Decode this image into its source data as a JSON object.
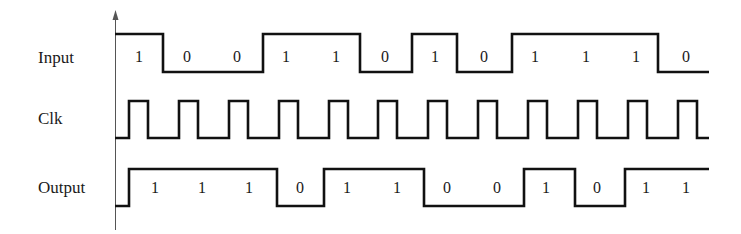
{
  "diagram": {
    "colors": {
      "wave": "#111111",
      "axis": "#555555",
      "text": "#1a1a1a",
      "background": "#ffffff"
    },
    "axis": {
      "x": 115.5,
      "y_top": 10,
      "y_bottom": 230
    },
    "time": {
      "x_start": 115,
      "bit_width": 49.7,
      "x_end": 709
    },
    "signals": [
      {
        "id": "input",
        "label": "Input",
        "label_y": 63,
        "y_high": 34,
        "y_low": 72,
        "text_y": 62,
        "start_level": 1,
        "edges": [
          163,
          263,
          360,
          412,
          457,
          512,
          658
        ],
        "bits": [
          "1",
          "0",
          "0",
          "1",
          "1",
          "0",
          "1",
          "0",
          "1",
          "1",
          "1",
          "0"
        ],
        "bit_x": [
          139,
          187,
          237,
          286,
          336,
          385,
          435,
          484,
          535,
          586,
          636,
          686
        ]
      },
      {
        "id": "clk",
        "label": "Clk",
        "label_y": 124,
        "y_high": 101,
        "y_low": 138,
        "start_level": 0,
        "pulse_rises": [
          129,
          179,
          229,
          279,
          329,
          378,
          428,
          478,
          528,
          578,
          628,
          678
        ],
        "pulse_width": 19
      },
      {
        "id": "output",
        "label": "Output",
        "label_y": 193,
        "y_high": 169,
        "y_low": 206,
        "text_y": 193,
        "start_level": 0,
        "edges": [
          129,
          277,
          324,
          424,
          524,
          575,
          625
        ],
        "bits": [
          "1",
          "1",
          "1",
          "0",
          "1",
          "1",
          "0",
          "0",
          "1",
          "0",
          "1",
          "1"
        ],
        "bit_x": [
          155,
          202,
          249,
          300,
          347,
          397,
          447,
          497,
          546,
          597,
          646,
          686
        ]
      }
    ]
  }
}
